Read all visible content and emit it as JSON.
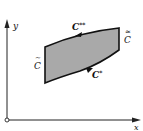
{
  "diagram": {
    "axes": {
      "x_label": "x",
      "y_label": "y"
    },
    "region": {
      "fill": "#a9a9a9",
      "stroke": "#111111"
    },
    "curves": {
      "upper": {
        "label": "C",
        "superscript": "**",
        "direction": "right-to-left"
      },
      "lower": {
        "label": "C",
        "superscript": "*",
        "direction": "left-to-right"
      },
      "left": {
        "label": "C",
        "accent": "~"
      },
      "right": {
        "label": "C",
        "accent": "≈"
      }
    }
  }
}
